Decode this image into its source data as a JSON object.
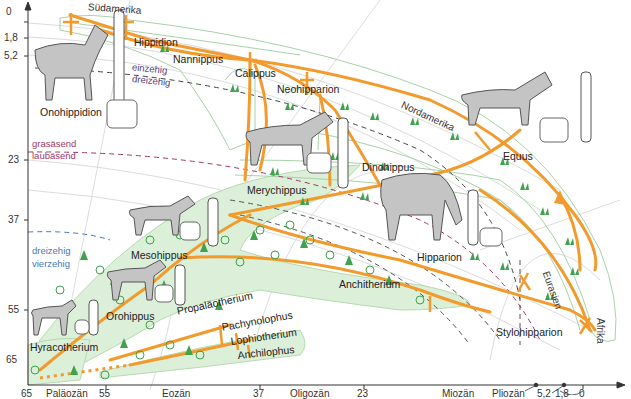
{
  "colors": {
    "lineage": "#f39a2c",
    "forest_zone": "#dcefd8",
    "forest_outline": "#9ccf95",
    "steppe_outline": "#9fc8a0",
    "grass": "#3fa34d",
    "diet_boundary": "#a0386a",
    "toe_boundary_blue": "#4a78b8",
    "toe_boundary_purple": "#50407a",
    "axis": "#333333",
    "gridline": "#d8d8d8"
  },
  "y_axis": {
    "unit_hint": "Millionen Jahre",
    "ticks": [
      "0",
      "1,8",
      "5,2",
      "23",
      "37",
      "55",
      "65"
    ]
  },
  "x_axis": {
    "ticks": [
      "65",
      "55",
      "37",
      "23",
      "5,2",
      "1,8",
      "0"
    ],
    "epochs": [
      "Paläozän",
      "Eozän",
      "Oligozän",
      "Miozän",
      "Pliozän",
      "Pleistozän + Holozän"
    ]
  },
  "regions": {
    "south_america": "Südamerika",
    "north_america": "Nordamerika",
    "eurasia": "Eurasien",
    "africa": "Afrika"
  },
  "boundaries": {
    "single_toed": "einzehig",
    "three_toed_upper": "dreizehig",
    "grazing": "grasäsend",
    "browsing": "laubäsend",
    "three_toed_lower": "dreizehig",
    "four_toed": "vierzehig"
  },
  "genera": {
    "onohippidion": "Onohippidion",
    "hippidion": "Hippidion",
    "nannippus": "Nannippus",
    "calippus": "Calippus",
    "neohipparion": "Neohipparion",
    "equus": "Equus",
    "merychippus": "Merychippus",
    "dinohippus": "Dinohippus",
    "hipparion": "Hipparion",
    "mesohippus": "Mesohippus",
    "orohippus": "Orohippus",
    "anchitherium": "Anchitherium",
    "hyracotherium": "Hyracotherium",
    "propalaeotherium": "Propaläotherium",
    "pachynolophus": "Pachynolophus",
    "lophiotherium": "Lophiotherium",
    "anchilophus": "Anchilophus",
    "stylohipparion": "Stylohipparion"
  }
}
